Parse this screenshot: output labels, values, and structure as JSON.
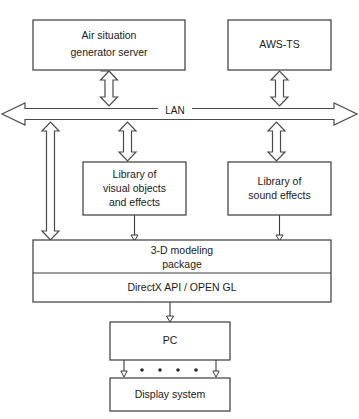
{
  "diagram": {
    "canvas": {
      "width": 359,
      "height": 419
    },
    "colors": {
      "background": "#ffffff",
      "stroke": "#3a3a3a",
      "arrow_stroke": "#4a4a4a",
      "text": "#1a1a1a"
    },
    "nodes": {
      "air_situation_server": {
        "label_line1": "Air situation",
        "label_line2": "generator server"
      },
      "aws_ts": {
        "label": "AWS-TS"
      },
      "lan": {
        "label": "LAN"
      },
      "library_visual": {
        "label_line1": "Library of",
        "label_line2": "visual objects",
        "label_line3": "and effects"
      },
      "library_sound": {
        "label_line1": "Library of",
        "label_line2": "sound effects"
      },
      "modeling_package": {
        "label_line1": "3-D modeling",
        "label_line2": "package"
      },
      "graphics_api": {
        "label": "DirectX API / OPEN GL"
      },
      "pc": {
        "label": "PC"
      },
      "display_system": {
        "label": "Display system"
      }
    },
    "connectors": [
      {
        "name": "server-to-lan",
        "kind": "block-arrow",
        "direction": "bidirectional"
      },
      {
        "name": "awsts-to-lan",
        "kind": "block-arrow",
        "direction": "bidirectional"
      },
      {
        "name": "lan-to-visual-library",
        "kind": "block-arrow",
        "direction": "bidirectional"
      },
      {
        "name": "lan-to-sound-library",
        "kind": "block-arrow",
        "direction": "bidirectional"
      },
      {
        "name": "lan-to-modeling-package",
        "kind": "block-arrow",
        "direction": "bidirectional"
      },
      {
        "name": "visual-library-to-modeling",
        "kind": "thin-arrow",
        "direction": "down"
      },
      {
        "name": "sound-library-to-modeling",
        "kind": "thin-arrow",
        "direction": "down"
      },
      {
        "name": "modeling-to-pc",
        "kind": "thin-arrow",
        "direction": "down"
      },
      {
        "name": "pc-to-display-left",
        "kind": "thin-arrow",
        "direction": "down"
      },
      {
        "name": "pc-to-display-right",
        "kind": "thin-arrow",
        "direction": "down"
      },
      {
        "name": "pc-to-display-ellipsis",
        "kind": "dots",
        "count": 4
      }
    ]
  }
}
